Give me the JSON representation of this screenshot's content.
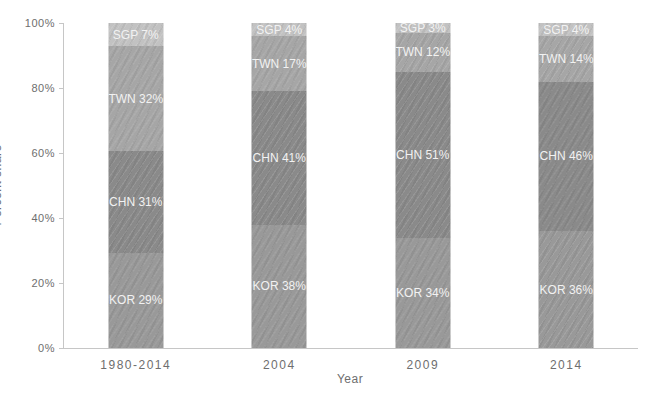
{
  "chart_data": {
    "type": "bar",
    "subtype": "stacked-percent",
    "title": "",
    "xlabel": "Year",
    "ylabel": "Percent share",
    "categories": [
      "1980-2014",
      "2004",
      "2009",
      "2014"
    ],
    "series": [
      {
        "name": "KOR",
        "color": "#999999",
        "values": [
          29,
          38,
          34,
          36
        ]
      },
      {
        "name": "CHN",
        "color": "#8a8a8a",
        "values": [
          31,
          41,
          51,
          46
        ]
      },
      {
        "name": "TWN",
        "color": "#a6a6a6",
        "values": [
          32,
          17,
          12,
          14
        ]
      },
      {
        "name": "SGP",
        "color": "#c2c2c2",
        "values": [
          7,
          4,
          3,
          4
        ]
      }
    ],
    "segment_labels": [
      [
        "KOR 29%",
        "CHN 31%",
        "TWN 32%",
        "SGP 7%"
      ],
      [
        "KOR 38%",
        "CHN 41%",
        "TWN 17%",
        "SGP 4%"
      ],
      [
        "KOR 34%",
        "CHN 51%",
        "TWN 12%",
        "SGP 3%"
      ],
      [
        "KOR 36%",
        "CHN 46%",
        "TWN 14%",
        "SGP 4%"
      ]
    ],
    "yticks": [
      "0%",
      "20%",
      "40%",
      "60%",
      "80%",
      "100%"
    ],
    "ylim": [
      0,
      100
    ],
    "grid": "off",
    "legend": "none",
    "label_text_color": "#f2f2f2",
    "axis_text_color": "#6e6e6e",
    "axis_line_color": "#c6c6c6"
  }
}
